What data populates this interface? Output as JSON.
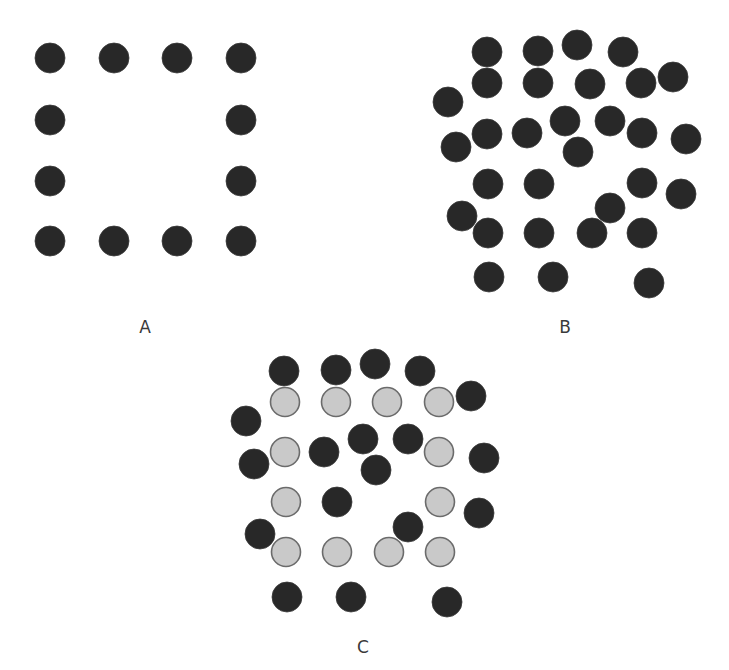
{
  "figure": {
    "dot_radius": 15,
    "colors": {
      "dark_fill": "#282828",
      "light_fill": "#c9c9c9",
      "light_stroke": "#6b6b6b",
      "label": "#3a3a3a"
    }
  },
  "panels": [
    {
      "id": "A",
      "label": "A",
      "label_pos": [
        145,
        327
      ],
      "dots": [
        {
          "x": 50,
          "y": 58,
          "tone": "dark"
        },
        {
          "x": 114,
          "y": 58,
          "tone": "dark"
        },
        {
          "x": 177,
          "y": 58,
          "tone": "dark"
        },
        {
          "x": 241,
          "y": 58,
          "tone": "dark"
        },
        {
          "x": 50,
          "y": 120,
          "tone": "dark"
        },
        {
          "x": 241,
          "y": 120,
          "tone": "dark"
        },
        {
          "x": 50,
          "y": 181,
          "tone": "dark"
        },
        {
          "x": 241,
          "y": 181,
          "tone": "dark"
        },
        {
          "x": 50,
          "y": 241,
          "tone": "dark"
        },
        {
          "x": 114,
          "y": 241,
          "tone": "dark"
        },
        {
          "x": 177,
          "y": 241,
          "tone": "dark"
        },
        {
          "x": 241,
          "y": 241,
          "tone": "dark"
        }
      ]
    },
    {
      "id": "B",
      "label": "B",
      "label_pos": [
        565,
        327
      ],
      "dots": [
        {
          "x": 487,
          "y": 52,
          "tone": "dark"
        },
        {
          "x": 538,
          "y": 51,
          "tone": "dark"
        },
        {
          "x": 577,
          "y": 45,
          "tone": "dark"
        },
        {
          "x": 623,
          "y": 52,
          "tone": "dark"
        },
        {
          "x": 487,
          "y": 83,
          "tone": "dark"
        },
        {
          "x": 538,
          "y": 83,
          "tone": "dark"
        },
        {
          "x": 590,
          "y": 84,
          "tone": "dark"
        },
        {
          "x": 641,
          "y": 83,
          "tone": "dark"
        },
        {
          "x": 673,
          "y": 77,
          "tone": "dark"
        },
        {
          "x": 448,
          "y": 102,
          "tone": "dark"
        },
        {
          "x": 456,
          "y": 147,
          "tone": "dark"
        },
        {
          "x": 487,
          "y": 134,
          "tone": "dark"
        },
        {
          "x": 527,
          "y": 133,
          "tone": "dark"
        },
        {
          "x": 565,
          "y": 121,
          "tone": "dark"
        },
        {
          "x": 610,
          "y": 121,
          "tone": "dark"
        },
        {
          "x": 642,
          "y": 133,
          "tone": "dark"
        },
        {
          "x": 686,
          "y": 139,
          "tone": "dark"
        },
        {
          "x": 578,
          "y": 152,
          "tone": "dark"
        },
        {
          "x": 488,
          "y": 184,
          "tone": "dark"
        },
        {
          "x": 539,
          "y": 184,
          "tone": "dark"
        },
        {
          "x": 642,
          "y": 183,
          "tone": "dark"
        },
        {
          "x": 681,
          "y": 194,
          "tone": "dark"
        },
        {
          "x": 610,
          "y": 208,
          "tone": "dark"
        },
        {
          "x": 462,
          "y": 216,
          "tone": "dark"
        },
        {
          "x": 488,
          "y": 233,
          "tone": "dark"
        },
        {
          "x": 539,
          "y": 233,
          "tone": "dark"
        },
        {
          "x": 592,
          "y": 233,
          "tone": "dark"
        },
        {
          "x": 642,
          "y": 233,
          "tone": "dark"
        },
        {
          "x": 489,
          "y": 277,
          "tone": "dark"
        },
        {
          "x": 553,
          "y": 277,
          "tone": "dark"
        },
        {
          "x": 649,
          "y": 283,
          "tone": "dark"
        }
      ]
    },
    {
      "id": "C",
      "label": "C",
      "label_pos": [
        363,
        647
      ],
      "dots": [
        {
          "x": 284,
          "y": 371,
          "tone": "dark"
        },
        {
          "x": 336,
          "y": 370,
          "tone": "dark"
        },
        {
          "x": 375,
          "y": 364,
          "tone": "dark"
        },
        {
          "x": 420,
          "y": 371,
          "tone": "dark"
        },
        {
          "x": 471,
          "y": 396,
          "tone": "dark"
        },
        {
          "x": 246,
          "y": 421,
          "tone": "dark"
        },
        {
          "x": 254,
          "y": 464,
          "tone": "dark"
        },
        {
          "x": 324,
          "y": 452,
          "tone": "dark"
        },
        {
          "x": 363,
          "y": 439,
          "tone": "dark"
        },
        {
          "x": 408,
          "y": 439,
          "tone": "dark"
        },
        {
          "x": 376,
          "y": 470,
          "tone": "dark"
        },
        {
          "x": 484,
          "y": 458,
          "tone": "dark"
        },
        {
          "x": 337,
          "y": 502,
          "tone": "dark"
        },
        {
          "x": 479,
          "y": 513,
          "tone": "dark"
        },
        {
          "x": 408,
          "y": 527,
          "tone": "dark"
        },
        {
          "x": 260,
          "y": 534,
          "tone": "dark"
        },
        {
          "x": 287,
          "y": 597,
          "tone": "dark"
        },
        {
          "x": 351,
          "y": 597,
          "tone": "dark"
        },
        {
          "x": 447,
          "y": 602,
          "tone": "dark"
        },
        {
          "x": 285,
          "y": 402,
          "tone": "light"
        },
        {
          "x": 336,
          "y": 402,
          "tone": "light"
        },
        {
          "x": 387,
          "y": 402,
          "tone": "light"
        },
        {
          "x": 439,
          "y": 402,
          "tone": "light"
        },
        {
          "x": 285,
          "y": 452,
          "tone": "light"
        },
        {
          "x": 439,
          "y": 452,
          "tone": "light"
        },
        {
          "x": 286,
          "y": 502,
          "tone": "light"
        },
        {
          "x": 440,
          "y": 502,
          "tone": "light"
        },
        {
          "x": 286,
          "y": 552,
          "tone": "light"
        },
        {
          "x": 337,
          "y": 552,
          "tone": "light"
        },
        {
          "x": 389,
          "y": 552,
          "tone": "light"
        },
        {
          "x": 440,
          "y": 552,
          "tone": "light"
        }
      ]
    }
  ]
}
